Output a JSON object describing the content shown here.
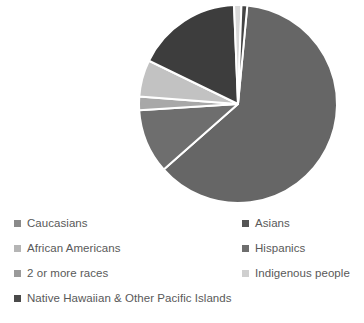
{
  "chart_data": {
    "type": "pie",
    "title": "",
    "subtitle": "",
    "xlabel": "",
    "ylabel": "",
    "grid": false,
    "legend_position": "bottom",
    "legend_columns": 2,
    "start_angle_deg": 0,
    "direction": "clockwise",
    "categories": [
      "Caucasians",
      "Asians",
      "African Americans",
      "Hispanics",
      "2 or more races",
      "Indigenous people",
      "Native Hawaiian & Other Pacific Islands"
    ],
    "values": [
      62.0,
      17.5,
      6.0,
      10.5,
      2.2,
      1.2,
      0.6
    ],
    "unit": "percent",
    "colors": [
      "#666666",
      "#3d3d3d",
      "#c2c2c2",
      "#6e6e6e",
      "#a8a8a8",
      "#d9d9d9",
      "#444444"
    ]
  },
  "pie": {
    "center_x": 238,
    "center_y": 104,
    "radius": 99,
    "separator_color": "#ffffff",
    "separator_width": 2,
    "slices": [
      {
        "name": "Caucasians",
        "start_deg": 5.4,
        "sweep_deg": 223.2,
        "color": "#666666"
      },
      {
        "name": "Hispanics",
        "start_deg": 228.6,
        "sweep_deg": 37.8,
        "color": "#6e6e6e"
      },
      {
        "name": "2 or more races",
        "start_deg": 266.4,
        "sweep_deg": 7.9,
        "color": "#a8a8a8"
      },
      {
        "name": "African Americans",
        "start_deg": 274.3,
        "sweep_deg": 21.6,
        "color": "#c2c2c2"
      },
      {
        "name": "Asians",
        "start_deg": 295.9,
        "sweep_deg": 61.8,
        "color": "#3d3d3d"
      },
      {
        "name": "Indigenous people",
        "start_deg": 357.7,
        "sweep_deg": 4.3,
        "color": "#d9d9d9"
      },
      {
        "name": "Native Hawaiian & Other Pacific Islands",
        "start_deg": 2.0,
        "sweep_deg": 3.4,
        "color": "#444444"
      }
    ]
  },
  "legend": {
    "rows": [
      {
        "left": {
          "label": "Caucasians",
          "color": "#8a8a8a"
        },
        "right": {
          "label": "Asians",
          "color": "#555555"
        }
      },
      {
        "left": {
          "label": "African Americans",
          "color": "#b5b5b5"
        },
        "right": {
          "label": "Hispanics",
          "color": "#6e6e6e"
        }
      },
      {
        "left": {
          "label": "2 or more races",
          "color": "#9a9a9a"
        },
        "right": {
          "label": "Indigenous people",
          "color": "#cfcfcf"
        }
      },
      {
        "wide": {
          "label": "Native Hawaiian & Other Pacific Islands",
          "color": "#4a4a4a"
        }
      }
    ]
  }
}
